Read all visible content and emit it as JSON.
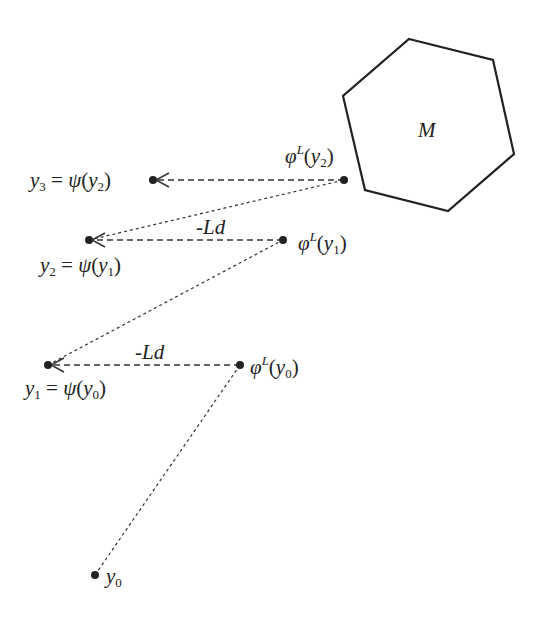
{
  "diagram": {
    "set_label": "M",
    "labels": {
      "y0": "y0",
      "y1_eq": "y1 = ψ(y0)",
      "y2_eq": "y2 = ψ(y1)",
      "y3_eq": "y3 = ψ(y2)",
      "phi_y0": "φL(y0)",
      "phi_y1": "φL(y1)",
      "phi_y2": "φL(y2)",
      "step_label_1": "-Ld",
      "step_label_2": "-Ld"
    },
    "points": {
      "y0": [
        95,
        575
      ],
      "phi_y0": [
        240,
        365
      ],
      "y1": [
        48,
        365
      ],
      "phi_y1": [
        283,
        240
      ],
      "y2": [
        89,
        240
      ],
      "phi_y2": [
        344,
        180
      ],
      "y3": [
        153,
        180
      ]
    },
    "hexagon": [
      [
        409,
        39
      ],
      [
        493,
        60
      ],
      [
        514,
        154
      ],
      [
        448,
        211
      ],
      [
        365,
        190
      ],
      [
        343,
        96
      ]
    ],
    "colors": {
      "stroke": "#222222",
      "fill": "#ffffff"
    }
  }
}
